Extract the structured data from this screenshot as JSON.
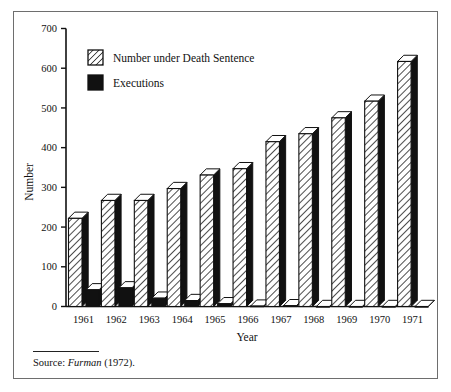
{
  "figure": {
    "source_prefix": "Source:",
    "source_italic": "Furman",
    "source_suffix": "(1972)."
  },
  "legend": {
    "items": [
      {
        "key": "death_sentence",
        "label": "Number under Death Sentence",
        "swatch": "hatched"
      },
      {
        "key": "executions",
        "label": "Executions",
        "swatch": "solid-black"
      }
    ]
  },
  "colors": {
    "ink": "#111111",
    "frame": "#6e6e6e",
    "bar_fill_hatch_bg": "#ffffff",
    "bar_hatch_line": "#111111",
    "bar_side": "#111111",
    "bar_top": "#ffffff",
    "executions_front": "#111111"
  },
  "chart_data": {
    "type": "bar",
    "title": "",
    "subtitle": "",
    "xlabel": "Year",
    "ylabel": "Number",
    "ylim": [
      0,
      700
    ],
    "ytick_labels": [
      "0",
      "100",
      "200",
      "300",
      "400",
      "500",
      "600",
      "700"
    ],
    "ytick_values": [
      0,
      100,
      200,
      300,
      400,
      500,
      600,
      700
    ],
    "grid": false,
    "legend_position": "upper-left-inside",
    "categories": [
      "1961",
      "1962",
      "1963",
      "1964",
      "1965",
      "1966",
      "1967",
      "1968",
      "1969",
      "1970",
      "1971"
    ],
    "series": [
      {
        "name": "Number under Death Sentence",
        "style": "hatched",
        "values": [
          222,
          267,
          267,
          297,
          331,
          347,
          415,
          435,
          475,
          517,
          617
        ]
      },
      {
        "name": "Executions",
        "style": "solid-black",
        "values": [
          42,
          47,
          21,
          15,
          7,
          1,
          2,
          0,
          0,
          0,
          0
        ]
      }
    ]
  }
}
